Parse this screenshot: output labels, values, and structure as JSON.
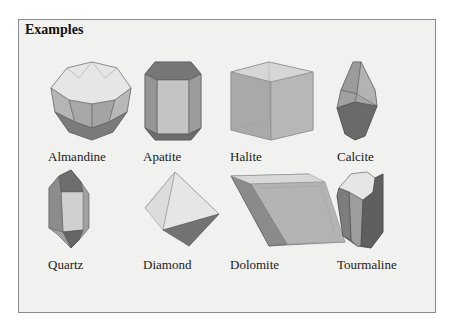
{
  "panel": {
    "title": "Examples",
    "minerals": [
      {
        "name": "Almandine",
        "shape": "trapezohedron-icon"
      },
      {
        "name": "Apatite",
        "shape": "hexagonal-prism-icon"
      },
      {
        "name": "Halite",
        "shape": "cube-icon"
      },
      {
        "name": "Calcite",
        "shape": "scalenohedron-icon"
      },
      {
        "name": "Quartz",
        "shape": "quartz-prism-icon"
      },
      {
        "name": "Diamond",
        "shape": "octahedron-icon"
      },
      {
        "name": "Dolomite",
        "shape": "rhombohedron-icon"
      },
      {
        "name": "Tourmaline",
        "shape": "trigonal-prism-icon"
      }
    ]
  },
  "colors": {
    "background": "#f1f1f0",
    "face_light": "#e3e3e3",
    "face_mid": "#a9a9a9",
    "face_dark": "#6f6f6f",
    "edge": "#555555"
  }
}
